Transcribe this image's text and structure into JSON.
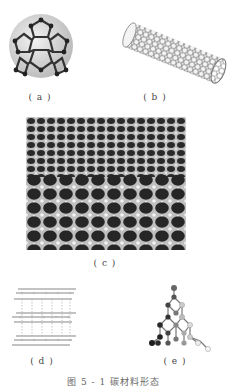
{
  "figure": {
    "panels": [
      {
        "id": "a",
        "label": "( a )",
        "subject": "fullerene-c60"
      },
      {
        "id": "b",
        "label": "( b )",
        "subject": "carbon-nanotube"
      },
      {
        "id": "c",
        "label": "( c )",
        "subject": "graphene-sheet"
      },
      {
        "id": "d",
        "label": "( d )",
        "subject": "graphite-layers"
      },
      {
        "id": "e",
        "label": "( e )",
        "subject": "diamond-lattice"
      }
    ],
    "caption": "图 5 - 1  碳材料形态"
  },
  "colors": {
    "background": "#ffffff",
    "atom_dark": "#2a2a2a",
    "atom_mid": "#8a8a8a",
    "atom_light": "#d8d8d8",
    "graphene_bg": "#333333"
  }
}
